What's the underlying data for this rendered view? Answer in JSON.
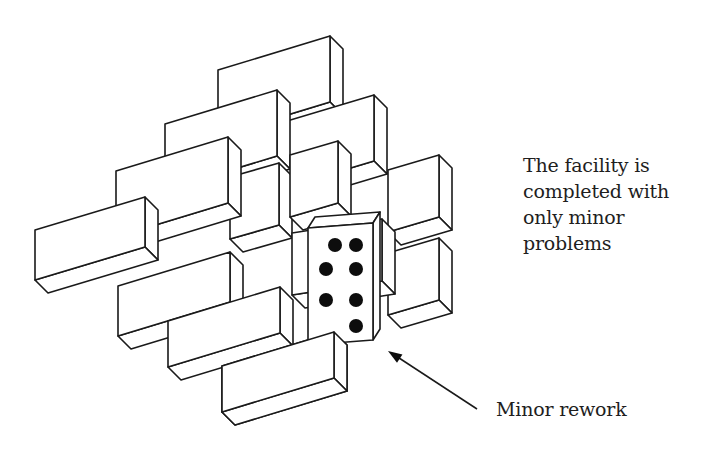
{
  "figure": {
    "status_caption_lines": [
      "The facility is",
      "completed with",
      "only minor",
      "problems"
    ],
    "rework_label": "Minor rework",
    "colors": {
      "stroke": "#1a1a1a",
      "fill": "#ffffff",
      "dot": "#0d0d0d",
      "text": "#1e1e1e"
    },
    "block_depth": {
      "dx": 13,
      "dy": 13
    },
    "blocks": [
      {
        "id": "r0c3",
        "x": 218,
        "y": 70,
        "w": 112,
        "h": 66,
        "slope": -34
      },
      {
        "id": "r1c4",
        "x": 277,
        "y": 124,
        "w": 97,
        "h": 66,
        "slope": -29
      },
      {
        "id": "r0c2",
        "x": 165,
        "y": 124,
        "w": 112,
        "h": 66,
        "slope": -34
      },
      {
        "id": "r2c5",
        "x": 388,
        "y": 170,
        "w": 51,
        "h": 62,
        "slope": -15
      },
      {
        "id": "r1c3",
        "x": 230,
        "y": 177,
        "w": 49,
        "h": 62,
        "slope": -14
      },
      {
        "id": "r1c4b",
        "x": 290,
        "y": 155,
        "w": 48,
        "h": 62,
        "slope": -14
      },
      {
        "id": "r0c1",
        "x": 116,
        "y": 171,
        "w": 112,
        "h": 66,
        "slope": -34
      },
      {
        "id": "r3c5",
        "x": 388,
        "y": 253,
        "w": 51,
        "h": 62,
        "slope": -15
      },
      {
        "id": "r2c4",
        "x": 292,
        "y": 233,
        "w": 90,
        "h": 62,
        "slope": -14
      },
      {
        "id": "r0c0",
        "x": 35,
        "y": 230,
        "w": 110,
        "h": 50,
        "slope": -33
      },
      {
        "id": "r1c2",
        "x": 118,
        "y": 286,
        "w": 112,
        "h": 50,
        "slope": -34
      },
      {
        "id": "r2c2",
        "x": 168,
        "y": 321,
        "w": 112,
        "h": 46,
        "slope": -34
      },
      {
        "id": "r3c3",
        "x": 222,
        "y": 366,
        "w": 112,
        "h": 46,
        "slope": -34
      }
    ],
    "rework_block": {
      "x": 308,
      "y": 228,
      "w": 65,
      "h": 117,
      "slope": -5,
      "dx": 7,
      "dy": -11,
      "dots": [
        [
          335,
          245
        ],
        [
          356,
          245
        ],
        [
          326,
          269
        ],
        [
          356,
          269
        ],
        [
          326,
          300
        ],
        [
          356,
          300
        ],
        [
          356,
          326
        ]
      ]
    },
    "occluder": {
      "x": 222,
      "y": 366,
      "w": 112,
      "h": 46,
      "slope": -34
    },
    "arrow": {
      "x1": 477,
      "y1": 409,
      "x2": 388,
      "y2": 351
    }
  }
}
